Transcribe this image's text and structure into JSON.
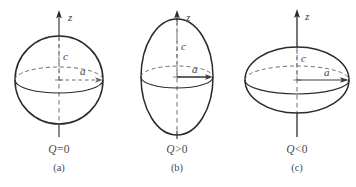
{
  "figure": {
    "axis_label": "z",
    "vertical_semiaxis_label": "c",
    "horizontal_semiaxis_label": "a",
    "stroke_color": "#2b2b2b",
    "dashed_color": "#6e6e6e",
    "text_color": "#4b4b4b",
    "background": "#ffffff"
  },
  "panels": [
    {
      "id": "a",
      "letter": "(a)",
      "q_symbol": "Q",
      "q_relation": "=",
      "q_value": "0",
      "q_label": "Q 0",
      "shape": "sphere",
      "axis_label": "z",
      "c_label": "c",
      "a_label": "a",
      "semi_a_px": 44,
      "semi_c_px": 44,
      "equator_ry_px": 13
    },
    {
      "id": "b",
      "letter": "(b)",
      "q_symbol": "Q",
      "q_relation": ">",
      "q_value": "0",
      "q_label": "Q 0",
      "shape": "prolate-spheroid",
      "axis_label": "z",
      "c_label": "c",
      "a_label": "a",
      "semi_a_px": 36,
      "semi_c_px": 58,
      "equator_ry_px": 11
    },
    {
      "id": "c",
      "letter": "(c)",
      "q_symbol": "Q",
      "q_relation": "<",
      "q_value": "0",
      "q_label": "Q 0",
      "shape": "oblate-spheroid",
      "axis_label": "z",
      "c_label": "c",
      "a_label": "a",
      "semi_a_px": 52,
      "semi_c_px": 33,
      "equator_ry_px": 14
    }
  ]
}
